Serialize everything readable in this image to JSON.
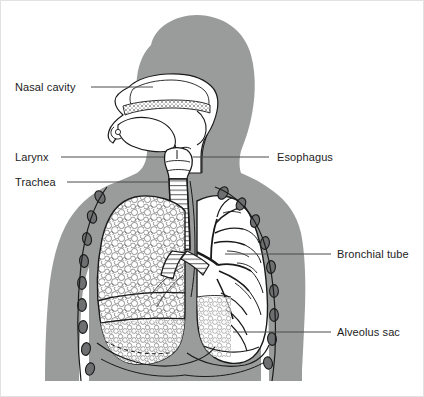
{
  "figure": {
    "background_color": "#ffffff",
    "border_color": "#e2e2e2",
    "width": 424,
    "height": 397
  },
  "palette": {
    "body_fill": "#9a9b9b",
    "body_fill_light": "#a8a9a9",
    "organ_fill": "#ffffff",
    "outline": "#1a1a1a",
    "rib_fill": "#6e6f70",
    "rib_outline": "#1a1a1a",
    "leader_line": "#4a4a4a",
    "label_text": "#1d1d1d",
    "nasal_stipple": "#2a2a2a",
    "lung_texture": "#3a3a3a"
  },
  "labels": [
    {
      "id": "nasal-cavity",
      "text": "Nasal cavity",
      "side": "left",
      "leader_from_x": 90,
      "leader_to_x": 152,
      "leader_y": 86
    },
    {
      "id": "larynx",
      "text": "Larynx",
      "side": "left",
      "leader_from_x": 60,
      "leader_to_x": 163,
      "leader_y": 156
    },
    {
      "id": "trachea",
      "text": "Trachea",
      "side": "left",
      "leader_from_x": 66,
      "leader_to_x": 168,
      "leader_y": 181
    },
    {
      "id": "esophagus",
      "text": "Esophagus",
      "side": "right",
      "leader_from_x": 268,
      "leader_to_x": 176,
      "leader_y": 156
    },
    {
      "id": "bronchial-tube",
      "text": "Bronchial tube",
      "side": "right",
      "leader_from_x": 330,
      "leader_to_x": 224,
      "leader_y": 253
    },
    {
      "id": "alveolus-sac",
      "text": "Alveolus sac",
      "side": "right",
      "leader_from_x": 330,
      "leader_to_x": 232,
      "leader_y": 331
    }
  ],
  "anatomy": {
    "parts": [
      "head-profile",
      "nasal-cavity",
      "hard-palate",
      "tongue",
      "oral-cavity",
      "pharynx",
      "larynx",
      "trachea",
      "esophagus",
      "left-lung",
      "right-lung",
      "bronchial-tree",
      "alveolar-texture",
      "diaphragm",
      "rib-cross-sections",
      "torso",
      "left-arm",
      "right-arm"
    ],
    "rib_count_left": 9,
    "rib_count_right": 9
  }
}
